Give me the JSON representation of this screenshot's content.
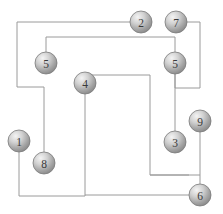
{
  "diagram": {
    "canvas": {
      "width": 223,
      "height": 214,
      "background": "#ffffff"
    },
    "style": {
      "edge_color": "#9a9a9a",
      "node_fill_light": "#e8e8e8",
      "node_fill_dark": "#8f8f8f",
      "node_stroke": "#7a7a7a",
      "label_color": "#3a3a3a",
      "node_radius": 11
    },
    "nodes": [
      {
        "id": "n1",
        "label": "1",
        "x": 19,
        "y": 141,
        "radius": 11,
        "name": "node-1"
      },
      {
        "id": "n2",
        "label": "2",
        "x": 141,
        "y": 22,
        "radius": 11,
        "name": "node-2"
      },
      {
        "id": "n7",
        "label": "7",
        "x": 176,
        "y": 22,
        "radius": 11,
        "name": "node-7"
      },
      {
        "id": "n5a",
        "label": "5",
        "x": 46,
        "y": 63,
        "radius": 11,
        "name": "node-5-left"
      },
      {
        "id": "n5b",
        "label": "5",
        "x": 175,
        "y": 63,
        "radius": 11,
        "name": "node-5-right"
      },
      {
        "id": "n4",
        "label": "4",
        "x": 85,
        "y": 83,
        "radius": 11,
        "name": "node-4"
      },
      {
        "id": "n9",
        "label": "9",
        "x": 200,
        "y": 121,
        "radius": 11,
        "name": "node-9"
      },
      {
        "id": "n3",
        "label": "3",
        "x": 175,
        "y": 142,
        "radius": 11,
        "name": "node-3"
      },
      {
        "id": "n8",
        "label": "8",
        "x": 44,
        "y": 163,
        "radius": 11,
        "name": "node-8"
      },
      {
        "id": "n6",
        "label": "6",
        "x": 200,
        "y": 195,
        "radius": 11,
        "name": "node-6"
      }
    ],
    "edges": [
      {
        "id": "e1",
        "name": "edge-2-to-8",
        "from": "n2",
        "to": "n8",
        "d": "M 130 22 L 17 22 L 17 87 L 44 87 L 44 152"
      },
      {
        "id": "e2",
        "name": "edge-5left-to-5right",
        "from": "n5a",
        "to": "n5b",
        "d": "M 46 52 L 46 37 L 175 37 L 175 52"
      },
      {
        "id": "e3",
        "name": "edge-7-to-5right",
        "from": "n7",
        "to": "n5b",
        "d": "M 187 22 L 200 22 L 200 88 L 175 88 L 175 74"
      },
      {
        "id": "e4",
        "name": "edge-5right-to-3",
        "from": "n5b",
        "to": "n3",
        "d": "M 175 74 L 175 131"
      },
      {
        "id": "e5",
        "name": "edge-4-to-6",
        "from": "n4",
        "to": "n6",
        "d": "M 85 72 L 85 75 L 150 75 L 150 175 L 189 175"
      },
      {
        "id": "e6",
        "name": "edge-1-to-4",
        "from": "n1",
        "to": "n4",
        "d": "M 19 152 L 19 196 L 85 196 L 85 94"
      },
      {
        "id": "e7",
        "name": "edge-9-to-6",
        "from": "n9",
        "to": "n6",
        "d": "M 200 132 L 200 184"
      },
      {
        "id": "e8",
        "name": "edge-6-left-stub",
        "from": "n6",
        "to": "n4",
        "d": "M 189 195 L 85 195"
      },
      {
        "id": "e9",
        "name": "edge-3-box-bottom",
        "from": "n3",
        "to": "n9",
        "d": "M 150 175 L 200 175"
      }
    ]
  }
}
